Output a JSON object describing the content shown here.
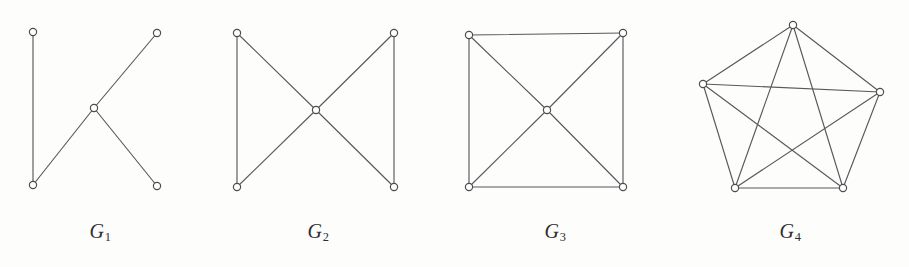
{
  "figure": {
    "background_color": "#fdfdfc",
    "edge_color": "#59595c",
    "node_fill": "#ffffff",
    "node_stroke": "#4d4d50",
    "node_radius": 3.6,
    "caption_color": "#2e2e30"
  },
  "graphs": [
    {
      "id": "G1",
      "label_letter": "G",
      "label_subscript": "1",
      "label_x": 100,
      "label_y": 220,
      "description": "tree on five vertices",
      "nodes": [
        {
          "name": "g1-node-top-left",
          "x": 33,
          "y": 32
        },
        {
          "name": "g1-node-top-right",
          "x": 157,
          "y": 33
        },
        {
          "name": "g1-node-center",
          "x": 94,
          "y": 108
        },
        {
          "name": "g1-node-bottom-left",
          "x": 33,
          "y": 185
        },
        {
          "name": "g1-node-bottom-right",
          "x": 157,
          "y": 186
        }
      ],
      "edges": [
        {
          "from": 0,
          "to": 3
        },
        {
          "from": 3,
          "to": 2
        },
        {
          "from": 2,
          "to": 1
        },
        {
          "from": 2,
          "to": 4
        }
      ]
    },
    {
      "id": "G2",
      "label_letter": "G",
      "label_subscript": "2",
      "label_x": 318,
      "label_y": 220,
      "description": "bowtie: two triangles sharing a central vertex",
      "nodes": [
        {
          "name": "g2-node-top-left",
          "x": 237,
          "y": 33
        },
        {
          "name": "g2-node-top-right",
          "x": 394,
          "y": 33
        },
        {
          "name": "g2-node-center",
          "x": 316,
          "y": 110
        },
        {
          "name": "g2-node-bottom-left",
          "x": 237,
          "y": 187
        },
        {
          "name": "g2-node-bottom-right",
          "x": 394,
          "y": 187
        }
      ],
      "edges": [
        {
          "from": 0,
          "to": 3
        },
        {
          "from": 1,
          "to": 4
        },
        {
          "from": 0,
          "to": 2
        },
        {
          "from": 2,
          "to": 3
        },
        {
          "from": 1,
          "to": 2
        },
        {
          "from": 2,
          "to": 4
        }
      ]
    },
    {
      "id": "G3",
      "label_letter": "G",
      "label_subscript": "3",
      "label_x": 555,
      "label_y": 220,
      "description": "square with both diagonals meeting at a central vertex",
      "nodes": [
        {
          "name": "g3-node-top-left",
          "x": 469,
          "y": 35
        },
        {
          "name": "g3-node-top-right",
          "x": 623,
          "y": 33
        },
        {
          "name": "g3-node-center",
          "x": 547,
          "y": 110
        },
        {
          "name": "g3-node-bottom-left",
          "x": 469,
          "y": 187
        },
        {
          "name": "g3-node-bottom-right",
          "x": 623,
          "y": 187
        }
      ],
      "edges": [
        {
          "from": 0,
          "to": 1
        },
        {
          "from": 1,
          "to": 4
        },
        {
          "from": 4,
          "to": 3
        },
        {
          "from": 3,
          "to": 0
        },
        {
          "from": 0,
          "to": 2
        },
        {
          "from": 2,
          "to": 4
        },
        {
          "from": 1,
          "to": 2
        },
        {
          "from": 2,
          "to": 3
        }
      ]
    },
    {
      "id": "G4",
      "label_letter": "G",
      "label_subscript": "4",
      "label_x": 790,
      "label_y": 220,
      "description": "complete graph on five vertices drawn as pentagon with pentagram",
      "nodes": [
        {
          "name": "g4-node-top",
          "x": 793,
          "y": 25
        },
        {
          "name": "g4-node-left",
          "x": 703,
          "y": 84
        },
        {
          "name": "g4-node-right",
          "x": 880,
          "y": 92
        },
        {
          "name": "g4-node-bottom-left",
          "x": 735,
          "y": 188
        },
        {
          "name": "g4-node-bottom-right",
          "x": 843,
          "y": 188
        }
      ],
      "edges": [
        {
          "from": 0,
          "to": 1
        },
        {
          "from": 0,
          "to": 2
        },
        {
          "from": 0,
          "to": 3
        },
        {
          "from": 0,
          "to": 4
        },
        {
          "from": 1,
          "to": 2
        },
        {
          "from": 1,
          "to": 3
        },
        {
          "from": 1,
          "to": 4
        },
        {
          "from": 2,
          "to": 3
        },
        {
          "from": 2,
          "to": 4
        },
        {
          "from": 3,
          "to": 4
        }
      ]
    }
  ]
}
